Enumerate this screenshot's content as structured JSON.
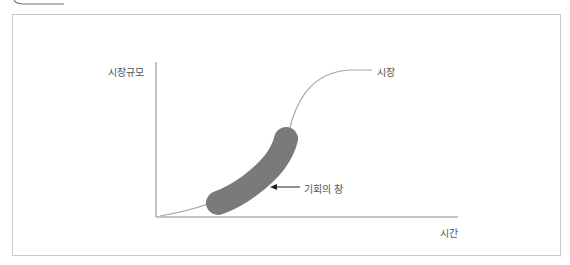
{
  "diagram": {
    "y_axis_label": "시장규모",
    "x_axis_label": "시간",
    "curve_label": "시장",
    "highlight_label": "기회의 창",
    "colors": {
      "frame": "#c8c8c8",
      "axis": "#888888",
      "curve": "#a8a8a8",
      "highlight": "#7a7a7a",
      "text": "#555555"
    }
  }
}
